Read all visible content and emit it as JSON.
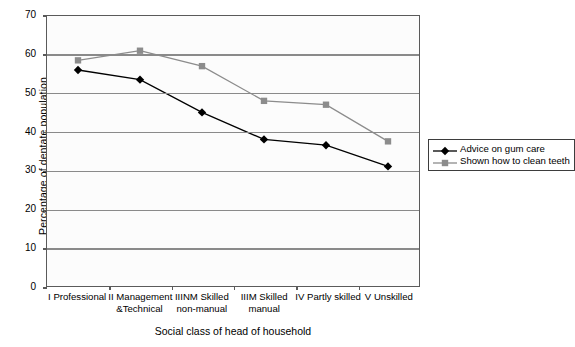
{
  "chart_data": {
    "type": "line",
    "title": "",
    "xlabel": "Social class of head of household",
    "ylabel": "Percentage of dentate population",
    "ylim": [
      0,
      70
    ],
    "ytick_step": 10,
    "yticks": [
      70,
      60,
      50,
      40,
      30,
      20,
      10,
      0
    ],
    "grid": true,
    "legend_position": "right",
    "categories": [
      "I Professional",
      "II Management &Technical",
      "IIINM Skilled non-manual",
      "IIIM Skilled manual",
      "IV Partly skilled",
      "V Unskilled"
    ],
    "category_lines": [
      [
        "I Professional",
        ""
      ],
      [
        "II Management",
        "&Technical"
      ],
      [
        "IIINM Skilled",
        "non-manual"
      ],
      [
        "IIIM Skilled",
        "manual"
      ],
      [
        "IV Partly skilled",
        ""
      ],
      [
        "V Unskilled",
        ""
      ]
    ],
    "series": [
      {
        "name": "Advice on gum care",
        "marker": "diamond",
        "color": "#000000",
        "values": [
          56,
          53.5,
          45,
          38,
          36.5,
          31
        ]
      },
      {
        "name": "Shown how to clean teeth",
        "marker": "square",
        "color": "#8c8c8c",
        "values": [
          58.5,
          61,
          57,
          48,
          47,
          37.5
        ]
      }
    ]
  },
  "colors": {
    "series_1": "#000000",
    "series_2": "#8c8c8c",
    "gridline": "#8a8a8a",
    "frame": "#5a5a5a",
    "plot_background": "#fcfcfc"
  }
}
